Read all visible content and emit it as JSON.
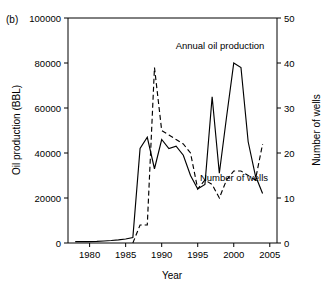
{
  "figure": {
    "panel_label": "(b)",
    "xlabel": "Year",
    "ylabel_left": "Oil production (BBL)",
    "ylabel_right": "Number of wells",
    "annotation_oil": "Annual oil production",
    "annotation_wells": "Number of wells",
    "line_color": "#000000",
    "background": "#ffffff"
  },
  "chart_data": {
    "type": "line",
    "title": "",
    "xlabel": "Year",
    "ylabel": "Oil production (BBL)",
    "ylabel_secondary": "Number of wells",
    "xlim": [
      1977,
      2006
    ],
    "ylim": [
      0,
      100000
    ],
    "ylim_secondary": [
      0,
      50
    ],
    "xticks": [
      1980,
      1985,
      1990,
      1995,
      2000,
      2005
    ],
    "xticklabels": [
      "1980",
      "1985",
      "1990",
      "1995",
      "2000",
      "2005"
    ],
    "yticks": [
      0,
      20000,
      40000,
      60000,
      80000,
      100000
    ],
    "yticklabels": [
      "0",
      "20000",
      "40000",
      "60000",
      "80000",
      "100000"
    ],
    "yticks_secondary": [
      0,
      10,
      20,
      30,
      40,
      50
    ],
    "yticklabels_secondary": [
      "0",
      "10",
      "20",
      "30",
      "40",
      "50"
    ],
    "grid": false,
    "legend": "inline-annotations",
    "series": [
      {
        "name": "Annual oil production",
        "axis": "left",
        "style": "solid",
        "units": "BBL",
        "x": [
          1978,
          1979,
          1980,
          1981,
          1982,
          1983,
          1984,
          1985,
          1986,
          1987,
          1988,
          1989,
          1990,
          1991,
          1992,
          1993,
          1994,
          1995,
          1996,
          1997,
          1998,
          1999,
          2000,
          2001,
          2002,
          2003,
          2004
        ],
        "values": [
          600,
          600,
          600,
          700,
          900,
          1100,
          1400,
          1800,
          2400,
          42000,
          47000,
          33000,
          46000,
          42000,
          43000,
          39000,
          30000,
          24000,
          26000,
          65000,
          31000,
          56000,
          80000,
          78000,
          45000,
          30000,
          22000
        ]
      },
      {
        "name": "Number of wells",
        "axis": "right",
        "style": "dashed",
        "units": "wells",
        "x": [
          1986,
          1987,
          1988,
          1989,
          1990,
          1991,
          1992,
          1993,
          1994,
          1995,
          1996,
          1997,
          1998,
          1999,
          2000,
          2001,
          2002,
          2003,
          2004
        ],
        "values": [
          0,
          4,
          4,
          39,
          25,
          24,
          23,
          22,
          20,
          12,
          14,
          13,
          10,
          14,
          16,
          16,
          15,
          14,
          22
        ]
      }
    ]
  }
}
